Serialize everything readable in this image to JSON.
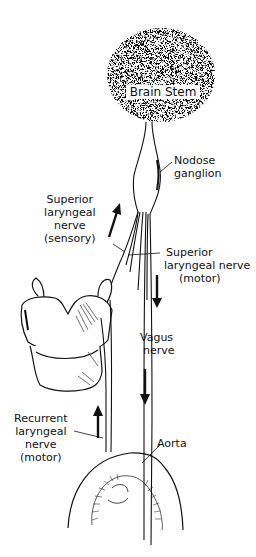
{
  "diagram": {
    "labels": {
      "brain_stem": "Brain Stem",
      "nodose_ganglion": [
        "Nodose",
        "ganglion"
      ],
      "sup_laryngeal_sensory": [
        "Superior",
        "laryngeal",
        "nerve",
        "(sensory)"
      ],
      "sup_laryngeal_motor": [
        "Superior",
        "laryngeal nerve",
        "(motor)"
      ],
      "vagus_nerve": [
        "Vagus",
        "nerve"
      ],
      "recurrent_laryngeal": [
        "Recurrent",
        "laryngeal",
        "nerve",
        "(motor)"
      ],
      "aorta": "Aorta"
    },
    "arrows": [
      {
        "name": "sensory-up-arrow",
        "direction": "up"
      },
      {
        "name": "motor-down-arrow",
        "direction": "down"
      },
      {
        "name": "vagus-down-arrow",
        "direction": "down"
      },
      {
        "name": "recurrent-up-arrow",
        "direction": "up"
      }
    ],
    "colors": {
      "ink": "#111111",
      "paper": "#ffffff"
    }
  }
}
